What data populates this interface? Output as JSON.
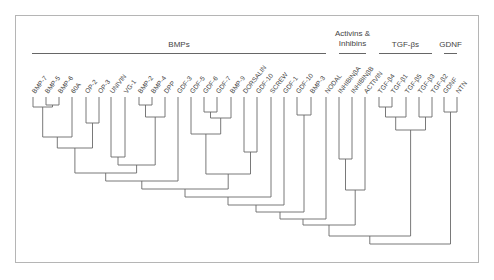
{
  "chart_data": {
    "type": "dendrogram",
    "title": "",
    "groups": [
      {
        "label": "BMPs",
        "x1": 32,
        "x2": 326
      },
      {
        "label_lines": [
          "Activins &",
          "Inhibins"
        ],
        "x1": 339,
        "x2": 366
      },
      {
        "label": "TGF-βs",
        "x1": 379,
        "x2": 432
      },
      {
        "label": "GDNF",
        "x1": 444,
        "x2": 457
      }
    ],
    "leaves": [
      {
        "label": "BMP-7",
        "x": 33
      },
      {
        "label": "BMP-5",
        "x": 46
      },
      {
        "label": "BMP-6",
        "x": 59
      },
      {
        "label": "60A",
        "x": 72
      },
      {
        "label": "OP-2",
        "x": 86
      },
      {
        "label": "OP-3",
        "x": 99
      },
      {
        "label": "UNIVIN",
        "x": 111
      },
      {
        "label": "VG-1",
        "x": 125
      },
      {
        "label": "BMP-2",
        "x": 139
      },
      {
        "label": "BMP-4",
        "x": 152
      },
      {
        "label": "DPP",
        "x": 165
      },
      {
        "label": "GDF-3",
        "x": 178
      },
      {
        "label": "GDF-5",
        "x": 191
      },
      {
        "label": "GDF-6",
        "x": 204
      },
      {
        "label": "GDF-7",
        "x": 217
      },
      {
        "label": "BMP-9",
        "x": 231
      },
      {
        "label": "DORSALIN",
        "x": 244
      },
      {
        "label": "GDF-10",
        "x": 257
      },
      {
        "label": "SCREW",
        "x": 271
      },
      {
        "label": "GDF-1",
        "x": 284
      },
      {
        "label": "GDF-10",
        "x": 297
      },
      {
        "label": "BMP-3",
        "x": 311
      },
      {
        "label": "NODAL",
        "x": 326
      },
      {
        "label": "INHIBINβA",
        "x": 339
      },
      {
        "label": "INHIBINβB",
        "x": 352
      },
      {
        "label": "ACTIVIN",
        "x": 365
      },
      {
        "label": "TGF-β4",
        "x": 379
      },
      {
        "label": "TGF-β1",
        "x": 392
      },
      {
        "label": "TGF-β5",
        "x": 406
      },
      {
        "label": "TGF-β3",
        "x": 419
      },
      {
        "label": "TGF-β2",
        "x": 432
      },
      {
        "label": "GDNF",
        "x": 444
      },
      {
        "label": "NTN",
        "x": 457
      }
    ],
    "leaf_top_y": 97,
    "merges": [
      {
        "a": 46,
        "ay": 97,
        "b": 59,
        "by": 97,
        "y": 105,
        "mid": 52.5
      },
      {
        "a": 33,
        "ay": 97,
        "b": 52.5,
        "by": 105,
        "y": 107,
        "mid": 42.7
      },
      {
        "a": 86,
        "ay": 97,
        "b": 99,
        "by": 97,
        "y": 123,
        "mid": 92.5
      },
      {
        "a": 42.7,
        "ay": 107,
        "b": 72,
        "by": 97,
        "y": 137,
        "mid": 57.3
      },
      {
        "a": 57.3,
        "ay": 137,
        "b": 92.5,
        "by": 123,
        "y": 148,
        "mid": 74.9
      },
      {
        "a": 139,
        "ay": 97,
        "b": 152,
        "by": 97,
        "y": 105,
        "mid": 145.5
      },
      {
        "a": 145.5,
        "ay": 105,
        "b": 165,
        "by": 97,
        "y": 117,
        "mid": 155.2
      },
      {
        "a": 111,
        "ay": 97,
        "b": 125,
        "by": 97,
        "y": 157,
        "mid": 118
      },
      {
        "a": 118,
        "ay": 157,
        "b": 155.2,
        "by": 117,
        "y": 165,
        "mid": 136.6
      },
      {
        "a": 74.9,
        "ay": 148,
        "b": 136.6,
        "by": 165,
        "y": 173,
        "mid": 105.7
      },
      {
        "a": 105.7,
        "ay": 173,
        "b": 178,
        "by": 97,
        "y": 181,
        "mid": 141.8
      },
      {
        "a": 204,
        "ay": 97,
        "b": 217,
        "by": 97,
        "y": 112,
        "mid": 210.5
      },
      {
        "a": 210.5,
        "ay": 112,
        "b": 231,
        "by": 97,
        "y": 118,
        "mid": 220.7
      },
      {
        "a": 191,
        "ay": 97,
        "b": 220.7,
        "by": 118,
        "y": 134,
        "mid": 205.9
      },
      {
        "a": 244,
        "ay": 97,
        "b": 257,
        "by": 97,
        "y": 152,
        "mid": 250.5
      },
      {
        "a": 205.9,
        "ay": 134,
        "b": 250.5,
        "by": 152,
        "y": 174,
        "mid": 228.2
      },
      {
        "a": 141.8,
        "ay": 181,
        "b": 228.2,
        "by": 174,
        "y": 189,
        "mid": 185
      },
      {
        "a": 185,
        "ay": 189,
        "b": 271,
        "by": 97,
        "y": 197,
        "mid": 228
      },
      {
        "a": 228,
        "ay": 197,
        "b": 284,
        "by": 97,
        "y": 205,
        "mid": 256
      },
      {
        "a": 297,
        "ay": 97,
        "b": 311,
        "by": 97,
        "y": 115,
        "mid": 304
      },
      {
        "a": 256,
        "ay": 205,
        "b": 304,
        "by": 115,
        "y": 212,
        "mid": 280
      },
      {
        "a": 280,
        "ay": 212,
        "b": 326,
        "by": 97,
        "y": 219,
        "mid": 303
      },
      {
        "a": 339,
        "ay": 97,
        "b": 352,
        "by": 97,
        "y": 159,
        "mid": 345.5
      },
      {
        "a": 345.5,
        "ay": 159,
        "b": 365,
        "by": 97,
        "y": 190,
        "mid": 355.2
      },
      {
        "a": 303,
        "ay": 219,
        "b": 355.2,
        "by": 190,
        "y": 225,
        "mid": 329
      },
      {
        "a": 379,
        "ay": 97,
        "b": 392,
        "by": 97,
        "y": 107,
        "mid": 385.5
      },
      {
        "a": 385.5,
        "ay": 107,
        "b": 406,
        "by": 97,
        "y": 117,
        "mid": 395.7
      },
      {
        "a": 419,
        "ay": 97,
        "b": 432,
        "by": 97,
        "y": 117,
        "mid": 425.5
      },
      {
        "a": 395.7,
        "ay": 117,
        "b": 425.5,
        "by": 117,
        "y": 130,
        "mid": 410.6
      },
      {
        "a": 329,
        "ay": 225,
        "b": 410.6,
        "by": 130,
        "y": 236,
        "mid": 369.8
      },
      {
        "a": 444,
        "ay": 97,
        "b": 457,
        "by": 97,
        "y": 112,
        "mid": 450.5
      },
      {
        "a": 369.8,
        "ay": 236,
        "b": 450.5,
        "by": 112,
        "y": 244,
        "mid": 410
      }
    ]
  }
}
